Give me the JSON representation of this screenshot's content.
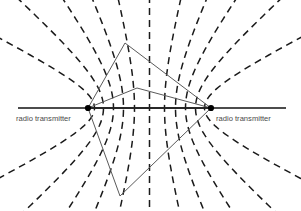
{
  "figure": {
    "background_color": "#ffffff",
    "width": 301,
    "height": 211
  },
  "labels": {
    "left_transmitter": "radio transmitter",
    "right_transmitter": "radio transmitter",
    "text_color": "#4a4a4a"
  },
  "chart_data": {
    "type": "diagram",
    "baseline": {
      "color": "#111111",
      "stroke_width": 1.6,
      "x1": 18,
      "y1": 108,
      "x2": 286,
      "y2": 108
    },
    "transmitters": [
      {
        "name": "left_transmitter",
        "x": 88,
        "y": 108,
        "radius": 3.1,
        "color": "#000000"
      },
      {
        "name": "right_transmitter",
        "x": 211,
        "y": 108,
        "radius": 3.1,
        "color": "#000000"
      }
    ],
    "label_positions": [
      {
        "text": "radio transmitter",
        "x": 16,
        "y": 121,
        "anchor": "start"
      },
      {
        "text": "radio transmitter",
        "x": 216,
        "y": 121,
        "anchor": "start"
      }
    ],
    "hyperbolas": {
      "stroke_color": "#1a1a1a",
      "stroke_width": 1.5,
      "dash_pattern": "7 5",
      "center_x": 149.5,
      "focal_half_distance": 61.5,
      "branch_offsets": [
        -55,
        -46,
        -36,
        -26,
        -15,
        0,
        15,
        26,
        36,
        46,
        55
      ],
      "count": 11,
      "note": "Vertical center line is the perpendicular bisector (zero time-difference line); branches curve outward toward each focus."
    },
    "fix_triangles": [
      {
        "name": "upper-fix-triangle",
        "stroke_color": "#5a5a5a",
        "stroke_width": 1.0,
        "points": [
          [
            88,
            108
          ],
          [
            125,
            43
          ],
          [
            211,
            108
          ]
        ]
      },
      {
        "name": "inner-fix-triangle",
        "stroke_color": "#5a5a5a",
        "stroke_width": 1.0,
        "points": [
          [
            88,
            108
          ],
          [
            137,
            88
          ],
          [
            211,
            108
          ]
        ]
      },
      {
        "name": "lower-fix-triangle",
        "stroke_color": "#5a5a5a",
        "stroke_width": 1.0,
        "points": [
          [
            88,
            108
          ],
          [
            120,
            196
          ],
          [
            211,
            108
          ]
        ]
      }
    ]
  }
}
